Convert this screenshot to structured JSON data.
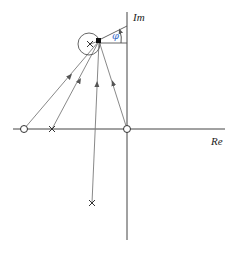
{
  "diagram": {
    "type": "pole-zero-plot",
    "axes": {
      "real_label": "Re",
      "imag_label": "Im"
    },
    "angle_label": "φ",
    "colors": {
      "axis": "#444444",
      "vector": "#7a7a7a",
      "angle_label": "#3a6fc9",
      "test_point": "#111111"
    },
    "poles": [
      {
        "id": "pole-real",
        "x": 52,
        "y": 129
      },
      {
        "id": "pole-upper",
        "x": 90,
        "y": 44
      },
      {
        "id": "pole-lower",
        "x": 92,
        "y": 203
      }
    ],
    "zeros": [
      {
        "id": "zero-left",
        "x": 24,
        "y": 129
      },
      {
        "id": "zero-origin",
        "x": 127,
        "y": 129
      }
    ],
    "test_point": {
      "x": 99,
      "y": 41
    },
    "neighborhood_circle": {
      "cx": 89,
      "cy": 44,
      "r": 11
    }
  }
}
